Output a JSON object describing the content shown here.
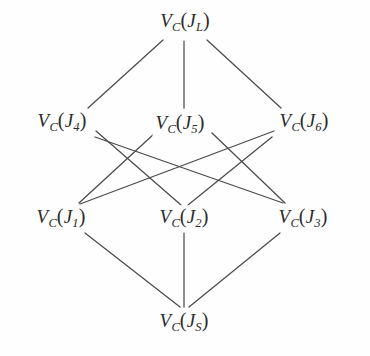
{
  "figure": {
    "type": "hasse-diagram",
    "title": "",
    "background_color": "#fefefe",
    "line_color": "#4a4a4a",
    "text_color": "#2b2b2b"
  },
  "nodes": [
    {
      "id": "JL",
      "label": "V_C(J_L)",
      "base": "V",
      "basesub": "C",
      "arg": "J",
      "argsub": "L",
      "x": 185,
      "y": 22,
      "level": 0
    },
    {
      "id": "J4",
      "label": "V_C(J_4)",
      "base": "V",
      "basesub": "C",
      "arg": "J",
      "argsub": "4",
      "x": 62,
      "y": 122,
      "level": 1
    },
    {
      "id": "J5",
      "label": "V_C(J_5)",
      "base": "V",
      "basesub": "C",
      "arg": "J",
      "argsub": "5",
      "x": 180,
      "y": 124,
      "level": 1
    },
    {
      "id": "J6",
      "label": "V_C(J_6)",
      "base": "V",
      "basesub": "C",
      "arg": "J",
      "argsub": "6",
      "x": 304,
      "y": 122,
      "level": 1
    },
    {
      "id": "J1",
      "label": "V_C(J_1)",
      "base": "V",
      "basesub": "C",
      "arg": "J",
      "argsub": "1",
      "x": 61,
      "y": 218,
      "level": 2
    },
    {
      "id": "J2",
      "label": "V_C(J_2)",
      "base": "V",
      "basesub": "C",
      "arg": "J",
      "argsub": "2",
      "x": 184,
      "y": 218,
      "level": 2
    },
    {
      "id": "J3",
      "label": "V_C(J_3)",
      "base": "V",
      "basesub": "C",
      "arg": "J",
      "argsub": "3",
      "x": 303,
      "y": 218,
      "level": 2
    },
    {
      "id": "JS",
      "label": "V_C(J_S)",
      "base": "V",
      "basesub": "C",
      "arg": "J",
      "argsub": "S",
      "x": 184,
      "y": 322,
      "level": 3
    }
  ],
  "edges": [
    {
      "from": "JL",
      "to": "J4",
      "x1": 163,
      "y1": 40,
      "x2": 88,
      "y2": 108
    },
    {
      "from": "JL",
      "to": "J5",
      "x1": 184,
      "y1": 41,
      "x2": 184,
      "y2": 108
    },
    {
      "from": "JL",
      "to": "J6",
      "x1": 207,
      "y1": 40,
      "x2": 281,
      "y2": 108
    },
    {
      "from": "J4",
      "to": "J2",
      "x1": 96,
      "y1": 131,
      "x2": 181,
      "y2": 205
    },
    {
      "from": "J4",
      "to": "J3",
      "x1": 95,
      "y1": 137,
      "x2": 283,
      "y2": 203
    },
    {
      "from": "J5",
      "to": "J1",
      "x1": 155,
      "y1": 133,
      "x2": 79,
      "y2": 203
    },
    {
      "from": "J5",
      "to": "J3",
      "x1": 212,
      "y1": 133,
      "x2": 285,
      "y2": 203
    },
    {
      "from": "J6",
      "to": "J1",
      "x1": 274,
      "y1": 131,
      "x2": 80,
      "y2": 204
    },
    {
      "from": "J6",
      "to": "J2",
      "x1": 272,
      "y1": 137,
      "x2": 188,
      "y2": 205
    },
    {
      "from": "J1",
      "to": "JS",
      "x1": 85,
      "y1": 233,
      "x2": 180,
      "y2": 307
    },
    {
      "from": "J2",
      "to": "JS",
      "x1": 184,
      "y1": 233,
      "x2": 184,
      "y2": 307
    },
    {
      "from": "J3",
      "to": "JS",
      "x1": 280,
      "y1": 233,
      "x2": 189,
      "y2": 307
    }
  ]
}
